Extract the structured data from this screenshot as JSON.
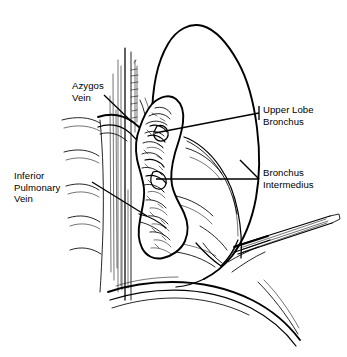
{
  "figure": {
    "kind": "anatomical-line-drawing",
    "background_color": "#ffffff",
    "ink_color": "#000000"
  },
  "labels": [
    {
      "id": "azygos-vein",
      "name": "Azygos Vein",
      "lines": [
        "Azygos",
        "Vein"
      ],
      "position": "upper-left",
      "leader": "from label down-right to vein arch at hilum"
    },
    {
      "id": "inferior-pulmonary-vein",
      "name": "Inferior Pulmonary Vein",
      "lines": [
        "Inferior",
        "Pulmonary",
        "Vein"
      ],
      "position": "mid-left",
      "leader": "from label down-right to lower hilar vessel"
    },
    {
      "id": "upper-lobe-bronchus",
      "name": "Upper Lobe Bronchus",
      "lines": [
        "Upper Lobe",
        "Bronchus"
      ],
      "position": "upper-right",
      "leader": "from label down-left to upper bronchial orifice"
    },
    {
      "id": "bronchus-intermedius",
      "name": "Bronchus Intermedius",
      "lines": [
        "Bronchus",
        "Intermedius"
      ],
      "position": "mid-right",
      "leader": "horizontal from label left to mid bronchus"
    }
  ],
  "structures": [
    {
      "id": "lung-outline",
      "name": "Lung (right lung, apex to base)"
    },
    {
      "id": "oblique-fissure",
      "name": "Oblique fissure"
    },
    {
      "id": "vertebral-column",
      "name": "Vertebral column / paravertebral gutter"
    },
    {
      "id": "azygos-arch",
      "name": "Azygos vein arch"
    },
    {
      "id": "hilar-mass",
      "name": "Hilar structures (bronchi, vessels, nodes)"
    },
    {
      "id": "diaphragm",
      "name": "Diaphragm"
    },
    {
      "id": "chest-wall",
      "name": "Chest wall / rib contours"
    },
    {
      "id": "surgical-instrument",
      "name": "Surgical clamp / retractor entering from right"
    }
  ]
}
